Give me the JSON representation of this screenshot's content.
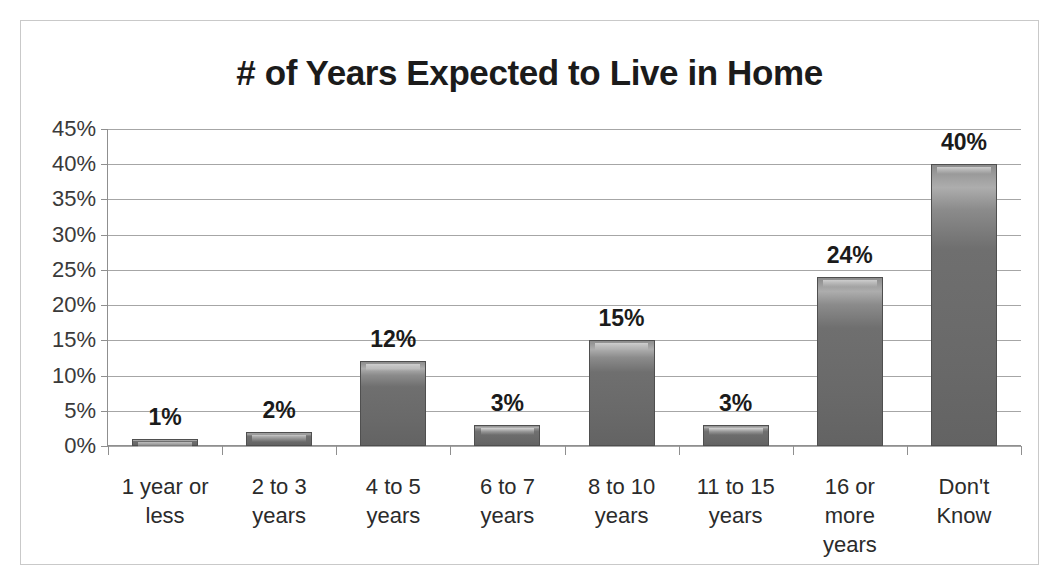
{
  "chart_data": {
    "type": "bar",
    "title": "# of Years Expected to Live in Home",
    "xlabel": "",
    "ylabel": "",
    "categories": [
      "1 year or less",
      "2 to 3 years",
      "4 to 5 years",
      "6 to 7 years",
      "8 to 10 years",
      "11 to 15 years",
      "16 or more years",
      "Don't Know"
    ],
    "values": [
      1,
      2,
      12,
      3,
      15,
      3,
      24,
      40
    ],
    "data_labels": [
      "1%",
      "2%",
      "12%",
      "3%",
      "15%",
      "3%",
      "24%",
      "40%"
    ],
    "ylim": [
      0,
      45
    ],
    "ytick_values": [
      0,
      5,
      10,
      15,
      20,
      25,
      30,
      35,
      40,
      45
    ],
    "ytick_labels": [
      "0%",
      "5%",
      "10%",
      "15%",
      "20%",
      "25%",
      "30%",
      "35%",
      "40%",
      "45%"
    ],
    "grid": true,
    "legend": false,
    "units": "percent",
    "bar_color": "#6f6f6f",
    "gridline_color": "#a6a6a6",
    "axis_color": "#8f8f8f",
    "text_color": "#1b1b1b",
    "background": "#ffffff"
  },
  "frame": {
    "border_color": "#c9c9c9"
  }
}
